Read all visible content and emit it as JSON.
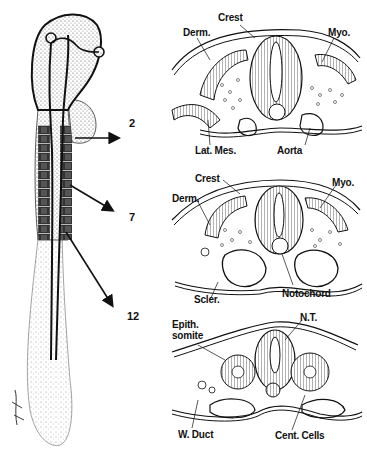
{
  "figure": {
    "colors": {
      "ink": "#111111",
      "background": "#ffffff",
      "stipple": "#666666"
    },
    "level_markers": [
      {
        "label": "2",
        "section": "top"
      },
      {
        "label": "7",
        "section": "middle"
      },
      {
        "label": "12",
        "section": "bottom"
      }
    ],
    "sections": {
      "top": {
        "labels": {
          "crest": "Crest",
          "derm": "Derm.",
          "myo": "Myo.",
          "lat_mes": "Lat. Mes.",
          "aorta": "Aorta"
        }
      },
      "middle": {
        "labels": {
          "crest": "Crest",
          "derm": "Derm.",
          "myo": "Myo.",
          "scler": "Scler.",
          "notochord": "Notochord"
        }
      },
      "bottom": {
        "labels": {
          "epith_somite_1": "Epith.",
          "epith_somite_2": "somite",
          "nt": "N.T.",
          "w_duct": "W. Duct",
          "cent_cells": "Cent. Cells"
        }
      }
    }
  }
}
